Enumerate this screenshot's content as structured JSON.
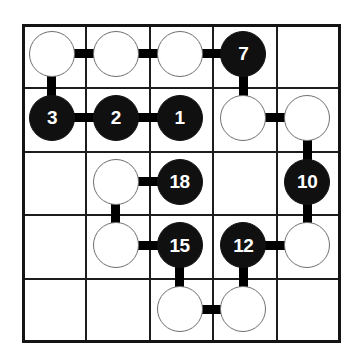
{
  "puzzle": {
    "title": "Numberlink-style node grid puzzle",
    "grid": {
      "rows": 5,
      "cols": 5,
      "cell_size": 63.8,
      "origin_x": 22,
      "origin_y": 24,
      "line_color": "#1d1d1d",
      "border_color": "#141414",
      "background": "#ffffff"
    },
    "node_style": {
      "diameter": 46,
      "white_fill": "#ffffff",
      "white_stroke": "#6f6f6f",
      "black_fill": "#101010",
      "black_text": "#ffffff",
      "edge_color": "#000000",
      "edge_thickness": 9
    },
    "nodes": [
      {
        "id": "n-r1c1",
        "row": 1,
        "col": 1,
        "type": "white",
        "label": ""
      },
      {
        "id": "n-r1c2",
        "row": 1,
        "col": 2,
        "type": "white",
        "label": ""
      },
      {
        "id": "n-r1c3",
        "row": 1,
        "col": 3,
        "type": "white",
        "label": ""
      },
      {
        "id": "n-r1c4",
        "row": 1,
        "col": 4,
        "type": "black",
        "label": "7"
      },
      {
        "id": "n-r2c1",
        "row": 2,
        "col": 1,
        "type": "black",
        "label": "3"
      },
      {
        "id": "n-r2c2",
        "row": 2,
        "col": 2,
        "type": "black",
        "label": "2"
      },
      {
        "id": "n-r2c3",
        "row": 2,
        "col": 3,
        "type": "black",
        "label": "1"
      },
      {
        "id": "n-r2c4",
        "row": 2,
        "col": 4,
        "type": "white",
        "label": ""
      },
      {
        "id": "n-r2c5",
        "row": 2,
        "col": 5,
        "type": "white",
        "label": ""
      },
      {
        "id": "n-r3c2",
        "row": 3,
        "col": 2,
        "type": "white",
        "label": ""
      },
      {
        "id": "n-r3c3",
        "row": 3,
        "col": 3,
        "type": "black",
        "label": "18"
      },
      {
        "id": "n-r3c5",
        "row": 3,
        "col": 5,
        "type": "black",
        "label": "10"
      },
      {
        "id": "n-r4c2",
        "row": 4,
        "col": 2,
        "type": "white",
        "label": ""
      },
      {
        "id": "n-r4c3",
        "row": 4,
        "col": 3,
        "type": "black",
        "label": "15"
      },
      {
        "id": "n-r4c4",
        "row": 4,
        "col": 4,
        "type": "black",
        "label": "12"
      },
      {
        "id": "n-r4c5",
        "row": 4,
        "col": 5,
        "type": "white",
        "label": ""
      },
      {
        "id": "n-r5c3",
        "row": 5,
        "col": 3,
        "type": "white",
        "label": ""
      },
      {
        "id": "n-r5c4",
        "row": 5,
        "col": 4,
        "type": "white",
        "label": ""
      }
    ],
    "edges": [
      {
        "id": "e-r1c1-r1c2",
        "orientation": "horizontal",
        "from": "n-r1c1",
        "to": "n-r1c2"
      },
      {
        "id": "e-r1c2-r1c3",
        "orientation": "horizontal",
        "from": "n-r1c2",
        "to": "n-r1c3"
      },
      {
        "id": "e-r1c3-r1c4",
        "orientation": "horizontal",
        "from": "n-r1c3",
        "to": "n-r1c4"
      },
      {
        "id": "e-r1c1-r2c1",
        "orientation": "vertical",
        "from": "n-r1c1",
        "to": "n-r2c1"
      },
      {
        "id": "e-r1c4-r2c4",
        "orientation": "vertical",
        "from": "n-r1c4",
        "to": "n-r2c4"
      },
      {
        "id": "e-r2c1-r2c2",
        "orientation": "horizontal",
        "from": "n-r2c1",
        "to": "n-r2c2"
      },
      {
        "id": "e-r2c2-r2c3",
        "orientation": "horizontal",
        "from": "n-r2c2",
        "to": "n-r2c3"
      },
      {
        "id": "e-r2c4-r2c5",
        "orientation": "horizontal",
        "from": "n-r2c4",
        "to": "n-r2c5"
      },
      {
        "id": "e-r2c5-r3c5",
        "orientation": "vertical",
        "from": "n-r2c5",
        "to": "n-r3c5"
      },
      {
        "id": "e-r3c2-r3c3",
        "orientation": "horizontal",
        "from": "n-r3c2",
        "to": "n-r3c3"
      },
      {
        "id": "e-r3c2-r4c2",
        "orientation": "vertical",
        "from": "n-r3c2",
        "to": "n-r4c2"
      },
      {
        "id": "e-r3c5-r4c5",
        "orientation": "vertical",
        "from": "n-r3c5",
        "to": "n-r4c5"
      },
      {
        "id": "e-r4c2-r4c3",
        "orientation": "horizontal",
        "from": "n-r4c2",
        "to": "n-r4c3"
      },
      {
        "id": "e-r4c4-r4c5",
        "orientation": "horizontal",
        "from": "n-r4c4",
        "to": "n-r4c5"
      },
      {
        "id": "e-r4c3-r5c3",
        "orientation": "vertical",
        "from": "n-r4c3",
        "to": "n-r5c3"
      },
      {
        "id": "e-r4c4-r5c4",
        "orientation": "vertical",
        "from": "n-r4c4",
        "to": "n-r5c4"
      },
      {
        "id": "e-r5c3-r5c4",
        "orientation": "horizontal",
        "from": "n-r5c3",
        "to": "n-r5c4"
      }
    ]
  }
}
